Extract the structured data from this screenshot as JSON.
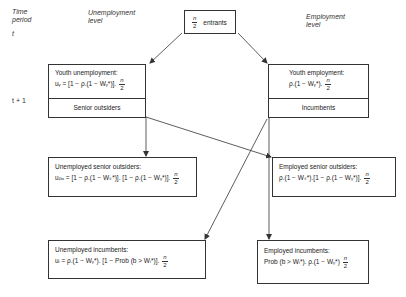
{
  "headers": {
    "time_period": "Time\nperiod",
    "time_period_line1": "Time",
    "time_period_line2": "period",
    "unemployment_level_line1": "Unemployment",
    "unemployment_level_line2": "level",
    "employment_level_line1": "Employment",
    "employment_level_line2": "level",
    "t_label": "t",
    "t1_label": "t + 1"
  },
  "entrants_box": {
    "fraction_num": "n",
    "fraction_den": "2",
    "label": "entrants"
  },
  "youth_unemployment_box": {
    "title": "Youth unemployment:",
    "formula": "uᵧ = [1 − ρ.(1 − Wᵧ*)].",
    "fraction_num": "n",
    "fraction_den": "2",
    "footer": "Senior outsiders"
  },
  "youth_employment_box": {
    "title": "Youth employment:",
    "formula": "ρ.(1 − Wᵧ*).",
    "fraction_num": "n",
    "fraction_den": "2",
    "footer": "Incumbents"
  },
  "unemployed_senior_outsiders_box": {
    "title": "Unemployed senior outsiders:",
    "formula": "uₚₒ = [1 − ρ.(1 − Wₛ*)]. [1 − ρ.(1 − Wᵧ*)].",
    "fraction_num": "n",
    "fraction_den": "2"
  },
  "employed_senior_outsiders_box": {
    "title": "Employed senior outsiders:",
    "formula": "ρ.(1 − Wₛ*).[1 − ρ.(1 − Wᵧ*)].",
    "fraction_num": "n",
    "fraction_den": "2"
  },
  "unemployed_incumbents_box": {
    "title": "Unemployed incumbents:",
    "formula": "uᵢ = ρ.(1 − Wᵧ*). [1 − Prob (b > Wᵢ*)].",
    "fraction_num": "n",
    "fraction_den": "2"
  },
  "employed_incumbents_box": {
    "title": "Employed incumbents:",
    "formula": "Prob (b > Wᵢ*). ρ.(1 − Wᵧ*)",
    "fraction_num": "n",
    "fraction_den": "2"
  },
  "colors": {
    "line": "#333333",
    "background": "#ffffff",
    "text": "#222222"
  }
}
